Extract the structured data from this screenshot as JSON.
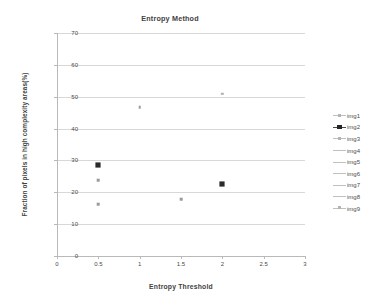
{
  "chart_data": {
    "type": "scatter",
    "title": "Entropy Method",
    "xlabel": "Entropy Threshold",
    "ylabel": "Fraction of pixels in high complexity areas(%)",
    "xlim": [
      0,
      3
    ],
    "ylim": [
      0,
      70
    ],
    "grid": "horizontal",
    "legend_position": "right",
    "x_ticks": [
      "0",
      "0.5",
      "1",
      "1.5",
      "2",
      "2.5",
      "3"
    ],
    "x_tick_values": [
      0,
      0.5,
      1,
      1.5,
      2,
      2.5,
      3
    ],
    "y_ticks": [
      "0",
      "10",
      "20",
      "30",
      "40",
      "50",
      "60",
      "70"
    ],
    "y_tick_values": [
      0,
      10,
      20,
      30,
      40,
      50,
      60,
      70
    ],
    "series": [
      {
        "name": "img1",
        "marker": "plus-square",
        "emphasis": "normal",
        "points": []
      },
      {
        "name": "img2",
        "marker": "filled-square",
        "emphasis": "bold",
        "points": [
          {
            "x": 0.5,
            "y": 28.5
          },
          {
            "x": 2.0,
            "y": 22.5
          }
        ]
      },
      {
        "name": "img3",
        "marker": "small-square",
        "emphasis": "faint",
        "points": [
          {
            "x": 0.5,
            "y": 23.7
          }
        ]
      },
      {
        "name": "img4",
        "marker": "small-square",
        "emphasis": "faint",
        "points": [
          {
            "x": 0.5,
            "y": 16.3
          }
        ]
      },
      {
        "name": "img5",
        "marker": "small-square",
        "emphasis": "faint",
        "points": [
          {
            "x": 1.0,
            "y": 46.8
          }
        ]
      },
      {
        "name": "img6",
        "marker": "line-only",
        "emphasis": "faint",
        "points": [
          {
            "x": 1.5,
            "y": 17.8
          }
        ]
      },
      {
        "name": "img7",
        "marker": "line-only",
        "emphasis": "faint",
        "points": [
          {
            "x": 2.0,
            "y": 51.0
          }
        ]
      },
      {
        "name": "img8",
        "marker": "line-only",
        "emphasis": "normal",
        "points": []
      },
      {
        "name": "img9",
        "marker": "small-square",
        "emphasis": "faint",
        "points": []
      }
    ],
    "all_points": [
      {
        "series": "img2",
        "x": 0.5,
        "y": 28.5,
        "style": "bold"
      },
      {
        "series": "img3",
        "x": 0.5,
        "y": 23.7,
        "style": "faint"
      },
      {
        "series": "img4",
        "x": 0.5,
        "y": 16.3,
        "style": "faint"
      },
      {
        "series": "img5",
        "x": 1.0,
        "y": 46.8,
        "style": "faint"
      },
      {
        "series": "img6",
        "x": 1.5,
        "y": 17.8,
        "style": "faint"
      },
      {
        "series": "img7",
        "x": 2.0,
        "y": 51.0,
        "style": "xfaint"
      },
      {
        "series": "img2",
        "x": 2.0,
        "y": 22.5,
        "style": "bold"
      }
    ]
  },
  "legend": {
    "entries": [
      {
        "label": "img1",
        "style": "marker-line"
      },
      {
        "label": "img2",
        "style": "bold"
      },
      {
        "label": "img3",
        "style": "marker-line"
      },
      {
        "label": "img4",
        "style": "line"
      },
      {
        "label": "img5",
        "style": "line"
      },
      {
        "label": "img6",
        "style": "line-short"
      },
      {
        "label": "img7",
        "style": "line-short"
      },
      {
        "label": "img8",
        "style": "line-long"
      },
      {
        "label": "img9",
        "style": "marker-line"
      }
    ]
  }
}
